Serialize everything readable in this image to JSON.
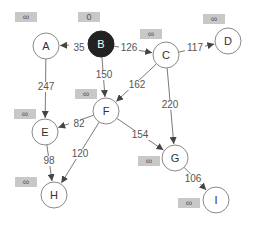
{
  "colors": {
    "source_fill": "#222222",
    "node_stroke": "#8a8a8a",
    "edge": "#7a7a7a",
    "dist_box": "#c8c8c8"
  },
  "nodes": [
    {
      "id": "A",
      "x": 46,
      "y": 46,
      "dist": "∞",
      "bx": 15,
      "by": 12,
      "source": false
    },
    {
      "id": "B",
      "x": 101,
      "y": 44,
      "dist": "0",
      "bx": 78,
      "by": 12,
      "source": true
    },
    {
      "id": "C",
      "x": 166,
      "y": 55,
      "dist": "∞",
      "bx": 140,
      "by": 29,
      "source": false
    },
    {
      "id": "D",
      "x": 228,
      "y": 41,
      "dist": "∞",
      "bx": 203,
      "by": 14,
      "source": false
    },
    {
      "id": "E",
      "x": 45,
      "y": 132,
      "dist": "∞",
      "bx": 14,
      "by": 109,
      "source": false
    },
    {
      "id": "F",
      "x": 106,
      "y": 111,
      "dist": "∞",
      "bx": 75,
      "by": 89,
      "source": false
    },
    {
      "id": "G",
      "x": 175,
      "y": 158,
      "dist": "∞",
      "bx": 138,
      "by": 156,
      "source": false
    },
    {
      "id": "H",
      "x": 54,
      "y": 195,
      "dist": "∞",
      "bx": 15,
      "by": 177,
      "source": false
    },
    {
      "id": "I",
      "x": 216,
      "y": 200,
      "dist": "∞",
      "bx": 178,
      "by": 198,
      "source": false
    }
  ],
  "edges": [
    {
      "from": "B",
      "to": "A",
      "w": "35",
      "lx": 79,
      "ly": 51
    },
    {
      "from": "B",
      "to": "C",
      "w": "126",
      "lx": 129,
      "ly": 51
    },
    {
      "from": "C",
      "to": "D",
      "w": "117",
      "lx": 195,
      "ly": 51
    },
    {
      "from": "B",
      "to": "F",
      "w": "150",
      "lx": 104,
      "ly": 78
    },
    {
      "from": "C",
      "to": "F",
      "w": "162",
      "lx": 137,
      "ly": 88
    },
    {
      "from": "A",
      "to": "E",
      "w": "247",
      "lx": 46,
      "ly": 90
    },
    {
      "from": "C",
      "to": "G",
      "w": "220",
      "lx": 170,
      "ly": 108
    },
    {
      "from": "F",
      "to": "E",
      "w": "82",
      "lx": 79,
      "ly": 127
    },
    {
      "from": "F",
      "to": "G",
      "w": "154",
      "lx": 140,
      "ly": 138
    },
    {
      "from": "E",
      "to": "H",
      "w": "98",
      "lx": 49,
      "ly": 164
    },
    {
      "from": "F",
      "to": "H",
      "w": "120",
      "lx": 80,
      "ly": 157
    },
    {
      "from": "G",
      "to": "I",
      "w": "106",
      "lx": 193,
      "ly": 182
    }
  ]
}
